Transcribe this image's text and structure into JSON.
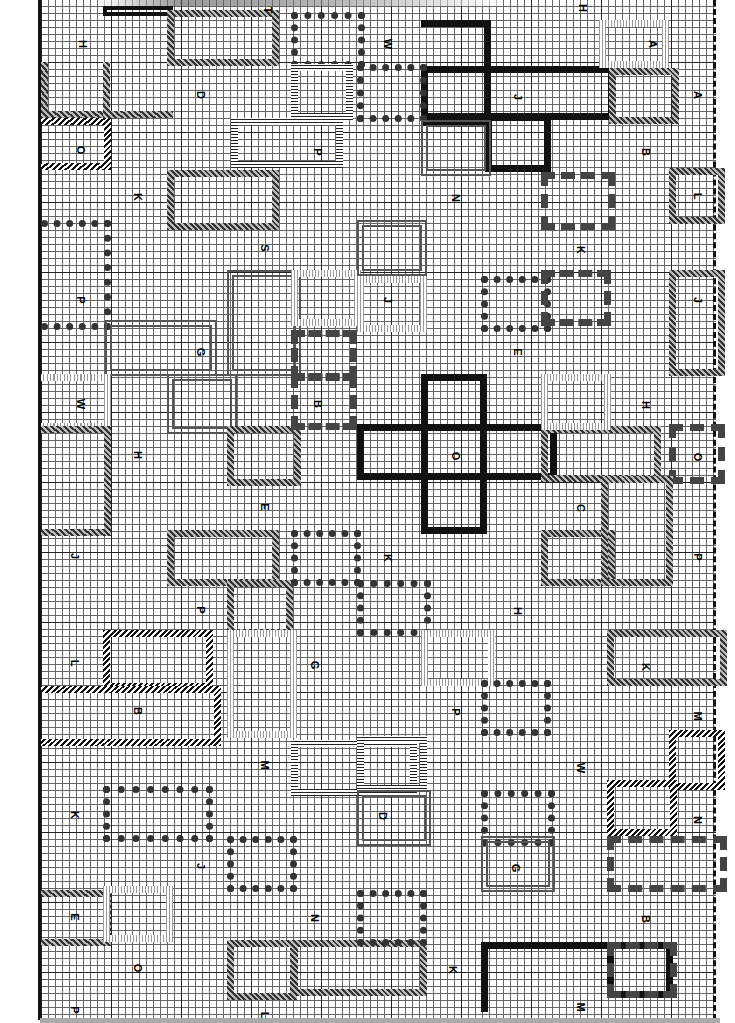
{
  "page": {
    "type": "cross-stitch chart (rotated 90°)",
    "grid": {
      "cell_px": 7,
      "major_every": 10,
      "columns": 96,
      "rows": 145
    }
  },
  "block_labels": [
    {
      "id": "H",
      "x": 80,
      "y": 44
    },
    {
      "id": "T",
      "x": 265,
      "y": 10
    },
    {
      "id": "W",
      "x": 385,
      "y": 44
    },
    {
      "id": "H",
      "x": 580,
      "y": 8
    },
    {
      "id": "A",
      "x": 650,
      "y": 44
    },
    {
      "id": "D",
      "x": 198,
      "y": 95
    },
    {
      "id": "J",
      "x": 515,
      "y": 97
    },
    {
      "id": "A",
      "x": 695,
      "y": 95
    },
    {
      "id": "O",
      "x": 78,
      "y": 150
    },
    {
      "id": "P",
      "x": 315,
      "y": 152
    },
    {
      "id": "B",
      "x": 643,
      "y": 152
    },
    {
      "id": "K",
      "x": 135,
      "y": 197
    },
    {
      "id": "N",
      "x": 453,
      "y": 198
    },
    {
      "id": "L",
      "x": 695,
      "y": 196
    },
    {
      "id": "S",
      "x": 262,
      "y": 248
    },
    {
      "id": "K",
      "x": 578,
      "y": 250
    },
    {
      "id": "P",
      "x": 78,
      "y": 300
    },
    {
      "id": "J",
      "x": 385,
      "y": 300
    },
    {
      "id": "J",
      "x": 695,
      "y": 300
    },
    {
      "id": "G",
      "x": 198,
      "y": 352
    },
    {
      "id": "E",
      "x": 515,
      "y": 352
    },
    {
      "id": "W",
      "x": 78,
      "y": 404
    },
    {
      "id": "B",
      "x": 315,
      "y": 404
    },
    {
      "id": "H",
      "x": 643,
      "y": 405
    },
    {
      "id": "H",
      "x": 135,
      "y": 455
    },
    {
      "id": "O",
      "x": 453,
      "y": 456
    },
    {
      "id": "O",
      "x": 695,
      "y": 457
    },
    {
      "id": "E",
      "x": 262,
      "y": 507
    },
    {
      "id": "C",
      "x": 578,
      "y": 508
    },
    {
      "id": "J",
      "x": 72,
      "y": 556
    },
    {
      "id": "K",
      "x": 385,
      "y": 558
    },
    {
      "id": "P",
      "x": 695,
      "y": 557
    },
    {
      "id": "P",
      "x": 198,
      "y": 610
    },
    {
      "id": "H",
      "x": 515,
      "y": 611
    },
    {
      "id": "L",
      "x": 72,
      "y": 663
    },
    {
      "id": "G",
      "x": 312,
      "y": 665
    },
    {
      "id": "K",
      "x": 643,
      "y": 667
    },
    {
      "id": "B",
      "x": 135,
      "y": 711
    },
    {
      "id": "P",
      "x": 453,
      "y": 712
    },
    {
      "id": "M",
      "x": 695,
      "y": 716
    },
    {
      "id": "M",
      "x": 262,
      "y": 765
    },
    {
      "id": "W",
      "x": 578,
      "y": 768
    },
    {
      "id": "K",
      "x": 72,
      "y": 815
    },
    {
      "id": "D",
      "x": 380,
      "y": 816
    },
    {
      "id": "N",
      "x": 695,
      "y": 820
    },
    {
      "id": "J",
      "x": 198,
      "y": 866
    },
    {
      "id": "G",
      "x": 513,
      "y": 868
    },
    {
      "id": "E",
      "x": 72,
      "y": 917
    },
    {
      "id": "N",
      "x": 312,
      "y": 918
    },
    {
      "id": "B",
      "x": 643,
      "y": 919
    },
    {
      "id": "O",
      "x": 135,
      "y": 968
    },
    {
      "id": "K",
      "x": 450,
      "y": 970
    },
    {
      "id": "P",
      "x": 72,
      "y": 1010
    },
    {
      "id": "L",
      "x": 262,
      "y": 1015
    },
    {
      "id": "M",
      "x": 578,
      "y": 1007
    }
  ],
  "symbol_key": {
    "solid": "filled square",
    "tri": "left-pointing triangle",
    "dot": "small dot",
    "circ": "open circle",
    "hatch": "diagonal slash",
    "light": "vertical tick",
    "x": "cross x",
    "plus": "plus sign"
  }
}
